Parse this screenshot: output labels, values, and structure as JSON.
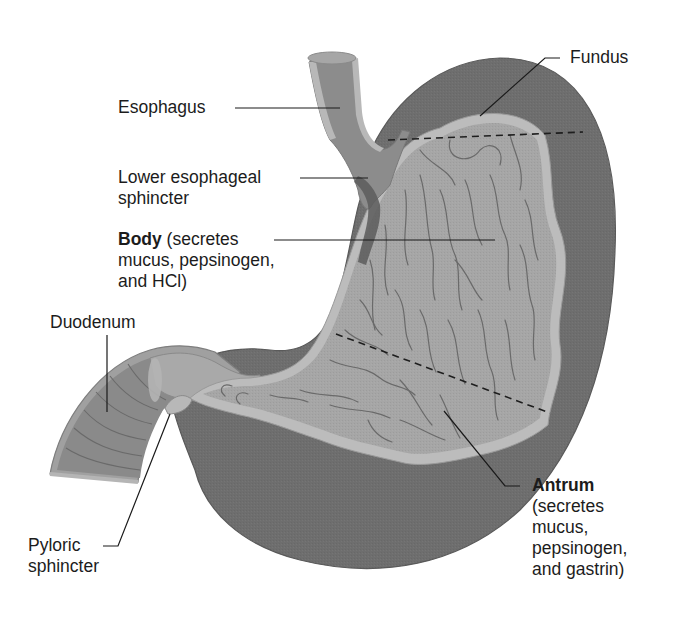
{
  "diagram": {
    "colors": {
      "muscle_wall": "#6e6e6e",
      "mucosa_border": "#b9b9b9",
      "lumen": "#a6a6a6",
      "rugae_lines": "#6a6a6a",
      "esophagus_wall": "#8c8c8c",
      "leader_lines": "#1a1a1a",
      "background": "#ffffff"
    },
    "labels": {
      "esophagus": {
        "line1": "Esophagus"
      },
      "fundus": {
        "line1": "Fundus"
      },
      "lower_esophageal_sphincter": {
        "line1": "Lower esophageal",
        "line2": "sphincter"
      },
      "body": {
        "title": "Body",
        "line1_rest": " (secretes",
        "line2": "mucus, pepsinogen,",
        "line3": "and HCl)"
      },
      "duodenum": {
        "line1": "Duodenum"
      },
      "pyloric_sphincter": {
        "line1": "Pyloric",
        "line2": "sphincter"
      },
      "antrum": {
        "title": "Antrum",
        "line2": "(secretes",
        "line3": "mucus,",
        "line4": "pepsinogen,",
        "line5": "and gastrin)"
      }
    },
    "region_dividers": [
      {
        "name": "fundus-body boundary",
        "style": "dashed"
      },
      {
        "name": "body-antrum boundary",
        "style": "dashed"
      }
    ]
  }
}
